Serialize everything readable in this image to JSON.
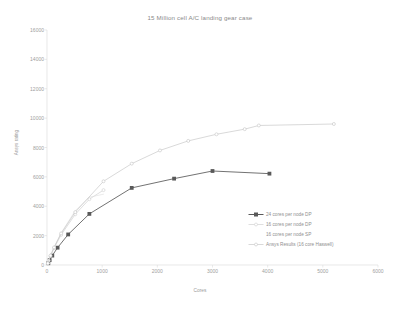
{
  "chart_data": {
    "type": "line",
    "title": "15 Million cell A/C landing gear case",
    "xlabel": "Cores",
    "ylabel": "Ansys rating",
    "xlim": [
      0,
      6000
    ],
    "ylim": [
      0,
      16000
    ],
    "xticks": [
      0,
      1000,
      2000,
      3000,
      4000,
      5000,
      6000
    ],
    "yticks": [
      0,
      2000,
      4000,
      6000,
      8000,
      10000,
      12000,
      14000,
      16000
    ],
    "grid": false,
    "legend_position": "inside-lower-right",
    "series": [
      {
        "name": "24 cores per node  DP",
        "color": "#595959",
        "marker": "square-filled",
        "x": [
          24,
          48,
          96,
          192,
          384,
          768,
          1536,
          2304,
          3000,
          4032
        ],
        "y": [
          120,
          330,
          640,
          1180,
          2080,
          3480,
          5250,
          5880,
          6400,
          6220
        ]
      },
      {
        "name": "16 cores per node  DP",
        "color": "#c9c9c9",
        "marker": "circle-open",
        "x": [
          16,
          32,
          64,
          128,
          256,
          512,
          768,
          1024
        ],
        "y": [
          110,
          300,
          610,
          1150,
          2050,
          3450,
          4480,
          5100
        ]
      },
      {
        "name": "16 cores per node  SP",
        "color": "#dedede",
        "marker": "none",
        "x": [
          16,
          32,
          64,
          128,
          256,
          512,
          768,
          1024
        ],
        "y": [
          115,
          315,
          640,
          1210,
          2180,
          3700,
          4620,
          4820
        ]
      },
      {
        "name": "Ansys Results (16 core Haswell)",
        "color": "#bfbfbf",
        "marker": "circle-open",
        "x": [
          16,
          64,
          128,
          256,
          512,
          1024,
          1536,
          2048,
          2560,
          3072,
          3584,
          3840,
          5200
        ],
        "y": [
          120,
          640,
          1200,
          2150,
          3600,
          5700,
          6900,
          7800,
          8450,
          8900,
          9250,
          9500,
          9600
        ]
      }
    ]
  },
  "legend": {
    "entries": [
      {
        "label": "24 cores per node  DP"
      },
      {
        "label": "16 cores per node  DP"
      },
      {
        "label": "16 cores per node  SP"
      },
      {
        "label": "Ansys Results (16 core Haswell)"
      }
    ]
  }
}
